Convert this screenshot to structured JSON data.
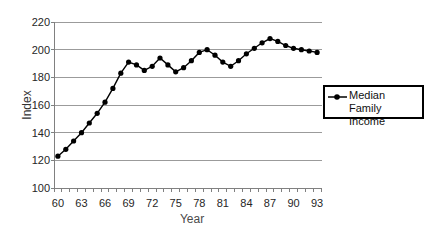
{
  "chart_data": {
    "type": "line",
    "title": "",
    "xlabel": "Year",
    "ylabel": "Index",
    "categories": [
      60,
      61,
      62,
      63,
      64,
      65,
      66,
      67,
      68,
      69,
      70,
      71,
      72,
      73,
      74,
      75,
      76,
      77,
      78,
      79,
      80,
      81,
      82,
      83,
      84,
      85,
      86,
      87,
      88,
      89,
      90,
      91,
      92,
      93
    ],
    "series": [
      {
        "name": "Median Family Income",
        "values": [
          123,
          128,
          134,
          140,
          147,
          154,
          162,
          172,
          183,
          191,
          189,
          185,
          188,
          194,
          189,
          184,
          187,
          192,
          198,
          200,
          196,
          191,
          188,
          192,
          197,
          201,
          205,
          208,
          206,
          203,
          201,
          200,
          199,
          198
        ]
      }
    ],
    "ylim": [
      100,
      220
    ],
    "ytick_step": 20,
    "x_label_every": 3,
    "x_tick_labels": [
      "60",
      "63",
      "66",
      "69",
      "72",
      "75",
      "78",
      "81",
      "84",
      "87",
      "90",
      "93"
    ],
    "grid": "horizontal",
    "legend_position": "right",
    "line_color": "#000000",
    "marker": "filled-circle",
    "gridline_color": "#9b9b9b",
    "axis_color": "#808080",
    "label_color": "#262626"
  }
}
